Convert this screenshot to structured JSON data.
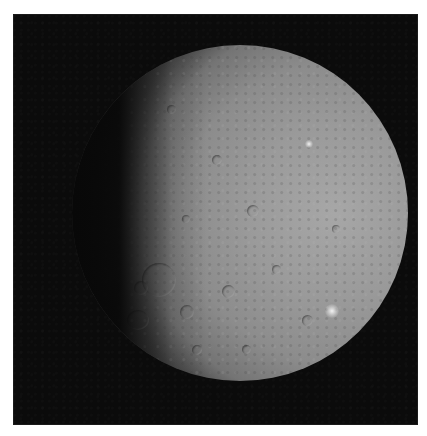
{
  "image": {
    "subject": "dwarf planet Ceres",
    "description": "Grayscale photograph of a cratered spherical body, partially lit from the right, against black space",
    "background_color": "#0b0b0b",
    "surface_color": "#9a9a9a",
    "highlight_color": "#f2f2f2"
  },
  "features": {
    "bright_spots": [
      {
        "label": "bright-spot-lower-right",
        "x": 332,
        "y": 311
      },
      {
        "label": "bright-spot-upper",
        "x": 310,
        "y": 144
      }
    ],
    "large_crater_left": {
      "x": 160,
      "y": 255,
      "diameter": 30
    }
  }
}
